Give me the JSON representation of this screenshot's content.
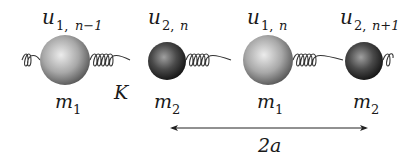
{
  "diagram": {
    "spring_constant_label": "K",
    "masses": [
      {
        "id": "m1-left",
        "mass_label": "m",
        "mass_sub": "1",
        "disp_label": "u",
        "disp_sub_a": "1, ",
        "disp_sub_b": "n−1",
        "size": "large",
        "cx": 65
      },
      {
        "id": "m2-left",
        "mass_label": "m",
        "mass_sub": "2",
        "disp_label": "u",
        "disp_sub_a": "2, ",
        "disp_sub_b": "n",
        "size": "small",
        "cx": 167
      },
      {
        "id": "m1-right",
        "mass_label": "m",
        "mass_sub": "1",
        "disp_label": "u",
        "disp_sub_a": "1, ",
        "disp_sub_b": "n",
        "size": "large",
        "cx": 268
      },
      {
        "id": "m2-right",
        "mass_label": "m",
        "mass_sub": "2",
        "disp_label": "u",
        "disp_sub_a": "2, ",
        "disp_sub_b": "n+1",
        "size": "small",
        "cx": 364
      }
    ],
    "lattice_constant_label": "2a",
    "colors": {
      "large_ball_light": "#e6e6e6",
      "large_ball_dark": "#5a5a5a",
      "small_ball_light": "#9a9a9a",
      "small_ball_dark": "#151515",
      "spring": "#333333",
      "text": "#1a1a1a"
    }
  }
}
